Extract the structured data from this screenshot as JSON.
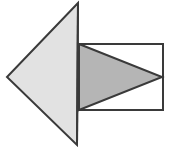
{
  "figure": {
    "canvas": {
      "width": 172,
      "height": 154,
      "background": "#ffffff"
    },
    "colors": {
      "outline": "#3a3a3a",
      "triangle_fill": "#e2e2e2",
      "rectangle_fill": "#ffffff",
      "overlap_fill": "#b5b5b5"
    },
    "stroke_width": 2,
    "shapes": [
      {
        "name": "left-triangle",
        "type": "triangle",
        "description": "Large light gray triangle pointing left",
        "points": "78,3 7,77 77,145",
        "fill": "#e2e2e2",
        "stroke": "#3a3a3a"
      },
      {
        "name": "rectangle",
        "type": "rectangle",
        "description": "White rectangle to the right of the triangle",
        "x": 78,
        "y": 44,
        "width": 85,
        "height": 66,
        "fill": "#ffffff",
        "stroke": "#3a3a3a"
      },
      {
        "name": "inner-triangle",
        "type": "triangle",
        "description": "Darker gray triangle pointing right, inscribed in the rectangle",
        "points": "79,44 162,77 79,110",
        "fill": "#b5b5b5",
        "stroke": "#3a3a3a"
      }
    ]
  }
}
